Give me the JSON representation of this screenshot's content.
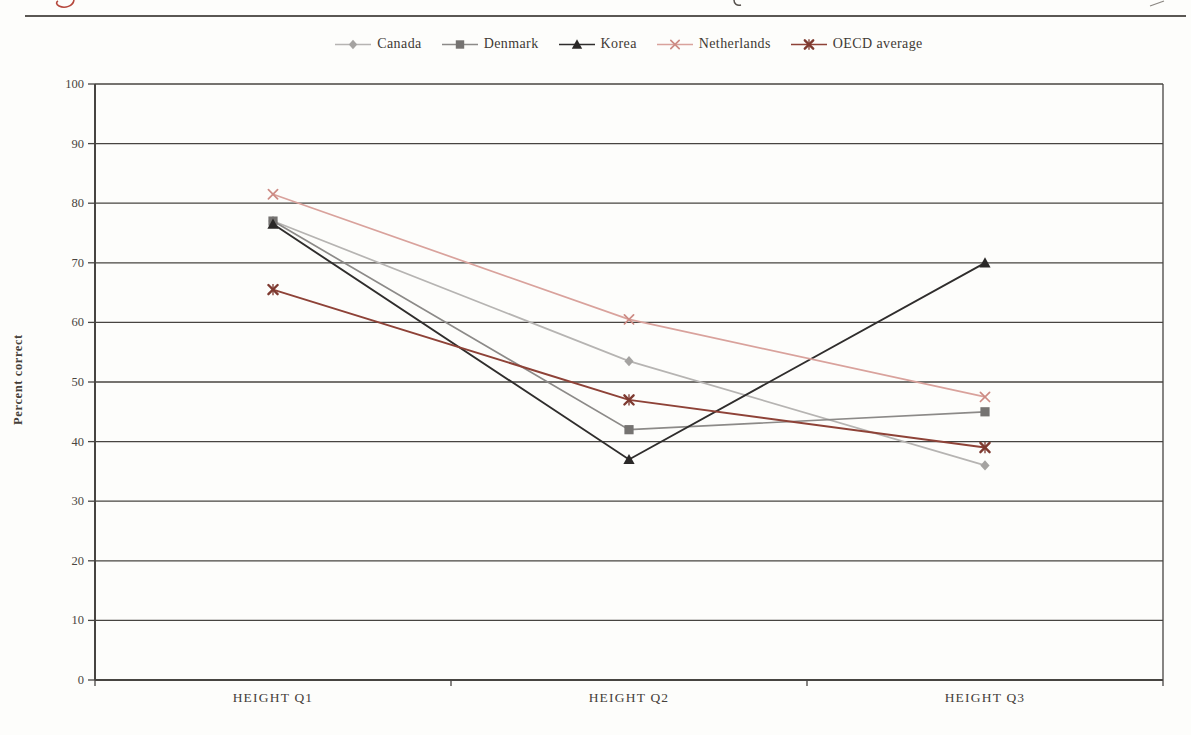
{
  "page": {
    "background": "#fdfdfb",
    "top_rule_color": "#5a5753",
    "header_fragment_red": "#b5473c",
    "header_fragment_dark": "#55504b"
  },
  "chart_data": {
    "type": "line",
    "title": "",
    "xlabel": "",
    "ylabel": "Percent correct",
    "categories": [
      "HEIGHT Q1",
      "HEIGHT Q2",
      "HEIGHT Q3"
    ],
    "ylim": [
      0,
      100
    ],
    "ytick_step": 10,
    "ytick_labels": [
      "0",
      "10",
      "20",
      "30",
      "40",
      "50",
      "60",
      "70",
      "80",
      "90",
      "100"
    ],
    "grid": "horizontal",
    "legend_position": "top-center",
    "axis_color": "#474441",
    "tick_label_color": "#4a453f",
    "series": [
      {
        "name": "Canada",
        "marker": "diamond",
        "line_color": "#b6b4b2",
        "marker_color": "#a5a3a1",
        "values": [
          77,
          53.5,
          36
        ]
      },
      {
        "name": "Denmark",
        "marker": "square",
        "line_color": "#8c8a88",
        "marker_color": "#757371",
        "values": [
          77,
          42,
          45
        ]
      },
      {
        "name": "Korea",
        "marker": "triangle",
        "line_color": "#2f2d2c",
        "marker_color": "#2a2827",
        "values": [
          76.5,
          37,
          70
        ]
      },
      {
        "name": "Netherlands",
        "marker": "x",
        "line_color": "#d9a29c",
        "marker_color": "#cd8b84",
        "values": [
          81.5,
          60.5,
          47.5
        ]
      },
      {
        "name": "OECD average",
        "marker": "asterisk",
        "line_color": "#8e4237",
        "marker_color": "#7e3a30",
        "values": [
          65.5,
          47,
          39
        ]
      }
    ]
  }
}
